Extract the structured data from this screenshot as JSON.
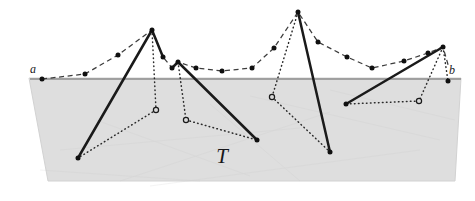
{
  "figure": {
    "width": 475,
    "height": 201,
    "background_color": "#ffffff",
    "labels": {
      "left_endpoint": "a",
      "right_endpoint": "b",
      "region": "T"
    },
    "colors": {
      "region_fill": "#dedede",
      "region_stroke": "#d2d2d2",
      "baseline": "#8d8d8d",
      "solid_path": "#1a1a1a",
      "dashed_path": "#3c3c3c",
      "dotted_path": "#2a2a2a",
      "vertex_fill": "#101010",
      "vertex_hollow_fill": "#d8d8d8",
      "vertex_hollow_stroke": "#1a1a1a",
      "label_color": "#17171a"
    },
    "geometry": {
      "baseline": {
        "x1": 30,
        "y1": 79,
        "x2": 461,
        "y2": 79
      },
      "region_polygon": [
        [
          29,
          78
        ],
        [
          461,
          78
        ],
        [
          455,
          181
        ],
        [
          48,
          181
        ]
      ],
      "label_positions": {
        "a": {
          "x": 33,
          "y": 73
        },
        "b": {
          "x": 452,
          "y": 74
        },
        "T": {
          "x": 222,
          "y": 163
        }
      },
      "dashed_polyline": [
        [
          42,
          79
        ],
        [
          85,
          74
        ],
        [
          118,
          55
        ],
        [
          152,
          30
        ],
        [
          163,
          57
        ],
        [
          172,
          68
        ],
        [
          178,
          62
        ],
        [
          196,
          68
        ],
        [
          222,
          71
        ],
        [
          252,
          68
        ],
        [
          274,
          48
        ],
        [
          298,
          12
        ],
        [
          318,
          42
        ],
        [
          347,
          57
        ],
        [
          372,
          68
        ],
        [
          404,
          61
        ],
        [
          428,
          53
        ],
        [
          443,
          47
        ],
        [
          449,
          68
        ]
      ],
      "solid_segments": [
        {
          "from": [
            152,
            30
          ],
          "to": [
            78,
            158
          ]
        },
        {
          "from": [
            152,
            30
          ],
          "to": [
            163,
            57
          ]
        },
        {
          "from": [
            178,
            62
          ],
          "to": [
            257,
            140
          ]
        },
        {
          "from": [
            178,
            62
          ],
          "to": [
            172,
            68
          ]
        },
        {
          "from": [
            298,
            12
          ],
          "to": [
            330,
            152
          ]
        },
        {
          "from": [
            443,
            47
          ],
          "to": [
            346,
            104
          ]
        }
      ],
      "dotted_segments": [
        {
          "from": [
            152,
            30
          ],
          "to": [
            156,
            110
          ]
        },
        {
          "from": [
            156,
            110
          ],
          "to": [
            78,
            158
          ]
        },
        {
          "from": [
            178,
            62
          ],
          "to": [
            186,
            120
          ]
        },
        {
          "from": [
            186,
            120
          ],
          "to": [
            257,
            140
          ]
        },
        {
          "from": [
            298,
            12
          ],
          "to": [
            272,
            97
          ]
        },
        {
          "from": [
            272,
            97
          ],
          "to": [
            330,
            152
          ]
        },
        {
          "from": [
            443,
            47
          ],
          "to": [
            448,
            81
          ]
        },
        {
          "from": [
            443,
            47
          ],
          "to": [
            419,
            101
          ]
        },
        {
          "from": [
            419,
            101
          ],
          "to": [
            346,
            104
          ]
        }
      ],
      "filled_vertices": [
        [
          42,
          79
        ],
        [
          85,
          74
        ],
        [
          118,
          55
        ],
        [
          152,
          30
        ],
        [
          163,
          57
        ],
        [
          172,
          68
        ],
        [
          178,
          62
        ],
        [
          196,
          68
        ],
        [
          222,
          71
        ],
        [
          252,
          68
        ],
        [
          274,
          48
        ],
        [
          298,
          12
        ],
        [
          318,
          42
        ],
        [
          347,
          57
        ],
        [
          372,
          68
        ],
        [
          404,
          61
        ],
        [
          428,
          53
        ],
        [
          443,
          47
        ],
        [
          448,
          81
        ],
        [
          78,
          158
        ],
        [
          257,
          140
        ],
        [
          330,
          152
        ],
        [
          346,
          104
        ]
      ],
      "hollow_vertices": [
        [
          156,
          110
        ],
        [
          186,
          120
        ],
        [
          272,
          97
        ],
        [
          419,
          101
        ]
      ]
    }
  }
}
